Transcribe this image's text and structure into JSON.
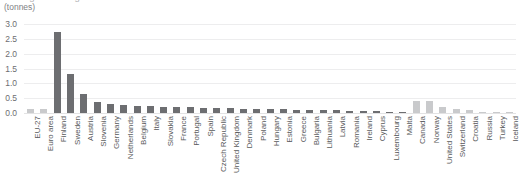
{
  "chart_data": {
    "type": "bar",
    "title": "Average annual generation of radioactive waste",
    "subtitle": "(tonnes)",
    "xlabel": "",
    "ylabel": "(tonnes)",
    "ylim": [
      0.0,
      3.0
    ],
    "ytick_labels": [
      "0.0",
      "0.5",
      "1.0",
      "1.5",
      "2.0",
      "2.5",
      "3.0"
    ],
    "ytick_values": [
      0.0,
      0.5,
      1.0,
      1.5,
      2.0,
      2.5,
      3.0
    ],
    "grid": true,
    "legend": "none",
    "colors": {
      "aggregate": "#c9cacc",
      "member_state": "#6d6e71",
      "non_member": "#c9cacc",
      "gridline": "#ededee",
      "text": "#58595b"
    },
    "categories": [
      "EU-27",
      "Euro area",
      "Finland",
      "Sweden",
      "Austria",
      "Slovenia",
      "Germany",
      "Netherlands",
      "Belgium",
      "Italy",
      "Slovakia",
      "France",
      "Portugal",
      "Spain",
      "Czech Republic",
      "United Kingdom",
      "Denmark",
      "Poland",
      "Hungary",
      "Estonia",
      "Greece",
      "Bulgaria",
      "Lithuania",
      "Latvia",
      "Romania",
      "Ireland",
      "Cyprus",
      "Luxembourg",
      "Malta",
      "Canada",
      "Norway",
      "United States",
      "Switzerland",
      "Croatia",
      "Russia",
      "Turkey",
      "Iceland"
    ],
    "values": [
      0.12,
      0.13,
      2.72,
      1.32,
      0.63,
      0.37,
      0.3,
      0.26,
      0.24,
      0.22,
      0.21,
      0.2,
      0.19,
      0.18,
      0.17,
      0.16,
      0.15,
      0.14,
      0.13,
      0.12,
      0.11,
      0.1,
      0.1,
      0.09,
      0.08,
      0.07,
      0.06,
      0.05,
      0.04,
      0.42,
      0.4,
      0.21,
      0.15,
      0.1,
      0.04,
      0.03,
      0.02
    ],
    "series_group": [
      "aggregate",
      "aggregate",
      "member_state",
      "member_state",
      "member_state",
      "member_state",
      "member_state",
      "member_state",
      "member_state",
      "member_state",
      "member_state",
      "member_state",
      "member_state",
      "member_state",
      "member_state",
      "member_state",
      "member_state",
      "member_state",
      "member_state",
      "member_state",
      "member_state",
      "member_state",
      "member_state",
      "member_state",
      "member_state",
      "member_state",
      "member_state",
      "member_state",
      "member_state",
      "non_member",
      "non_member",
      "non_member",
      "non_member",
      "non_member",
      "non_member",
      "non_member",
      "non_member"
    ]
  }
}
